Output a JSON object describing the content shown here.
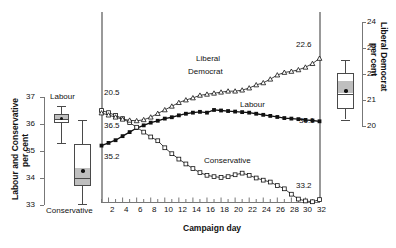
{
  "chart_data": {
    "type": "line",
    "title": "",
    "xlabel": "Campaign day",
    "ylabel_left": "Labour and Conservative per cent",
    "ylabel_right": "Liberal Democrat per cent",
    "x": [
      1,
      2,
      3,
      4,
      5,
      6,
      7,
      8,
      9,
      10,
      11,
      12,
      13,
      14,
      15,
      16,
      17,
      18,
      19,
      20,
      21,
      22,
      23,
      24,
      25,
      26,
      27,
      28,
      29,
      30,
      31,
      32
    ],
    "xlim": [
      1,
      32
    ],
    "xticks": [
      2,
      4,
      6,
      8,
      10,
      12,
      14,
      16,
      18,
      20,
      22,
      24,
      26,
      28,
      30,
      32
    ],
    "ylim_left": [
      33,
      37
    ],
    "yticks_left": [
      33,
      34,
      35,
      36,
      37
    ],
    "ylim_right": [
      20,
      24
    ],
    "yticks_right": [
      20,
      21,
      22,
      23,
      24
    ],
    "grid": false,
    "legend": "inline-annotations",
    "series": [
      {
        "name": "Labour",
        "axis": "left",
        "marker": "filled-square",
        "start_label": "35.2",
        "end_label": "36.1",
        "values": [
          35.2,
          35.3,
          35.4,
          35.55,
          35.7,
          35.85,
          35.95,
          36.05,
          36.12,
          36.2,
          36.25,
          36.32,
          36.38,
          36.42,
          36.45,
          36.42,
          36.52,
          36.5,
          36.48,
          36.46,
          36.44,
          36.42,
          36.38,
          36.34,
          36.3,
          36.26,
          36.22,
          36.2,
          36.18,
          36.15,
          36.13,
          36.1
        ]
      },
      {
        "name": "Conservative",
        "axis": "left",
        "marker": "open-square",
        "start_label": "36.5",
        "end_label": "33.2",
        "values": [
          36.5,
          36.42,
          36.32,
          36.2,
          36.05,
          35.88,
          35.7,
          35.52,
          35.38,
          35.12,
          34.9,
          34.7,
          34.52,
          34.35,
          34.2,
          34.1,
          34.05,
          34.02,
          34.05,
          34.12,
          34.18,
          34.1,
          34.0,
          33.92,
          33.85,
          33.72,
          33.6,
          33.4,
          33.22,
          33.15,
          33.12,
          33.2
        ]
      },
      {
        "name": "Liberal Democrat",
        "axis": "right",
        "marker": "open-triangle",
        "start_label": "20.5",
        "end_label": "22.6",
        "values": [
          20.5,
          20.42,
          20.34,
          20.26,
          20.22,
          20.2,
          20.24,
          20.34,
          20.48,
          20.62,
          20.76,
          20.9,
          21.0,
          21.08,
          21.18,
          21.22,
          21.26,
          21.3,
          21.34,
          21.34,
          21.38,
          21.46,
          21.58,
          21.66,
          21.8,
          21.96,
          22.06,
          22.1,
          22.16,
          22.26,
          22.4,
          22.6
        ]
      }
    ],
    "annotations": [
      {
        "text": "Liberal",
        "series": "Liberal Democrat"
      },
      {
        "text": "Democrat",
        "series": "Liberal Democrat"
      },
      {
        "text": "Labour",
        "series": "Labour"
      },
      {
        "text": "Conservative",
        "series": "Conservative"
      }
    ],
    "boxplots": [
      {
        "name": "Labour",
        "axis": "left",
        "label": "Labour",
        "min": 35.42,
        "q1": 36.05,
        "median": 36.22,
        "q3": 36.38,
        "max": 36.68,
        "mean": 36.18
      },
      {
        "name": "Conservative",
        "axis": "left",
        "label": "Conservative",
        "min": 33.1,
        "q1": 33.7,
        "median": 34.0,
        "q3": 35.25,
        "max": 36.15,
        "mean": 34.32
      },
      {
        "name": "Liberal Democrat",
        "axis": "right",
        "label": "",
        "min": 20.25,
        "q1": 20.62,
        "median": 21.22,
        "q3": 22.05,
        "max": 22.55,
        "mean": 21.25
      }
    ]
  },
  "labels": {
    "y_left_line1": "Labour and Conservative",
    "y_left_line2": "per cent",
    "y_right_line1": "Liberal Democrat",
    "y_right_line2": "per cent",
    "x_axis": "Campaign day",
    "box_labour": "Labour",
    "box_conservative": "Conservative",
    "ann_liberal": "Liberal",
    "ann_democrat": "Democrat",
    "ann_labour": "Labour",
    "ann_conservative": "Conservative",
    "start_libdem": "20.5",
    "start_con": "36.5",
    "start_lab": "35.2",
    "end_libdem": "22.6",
    "end_lab": "36.1",
    "end_con": "33.2",
    "yl_33": "33",
    "yl_34": "34",
    "yl_35": "35",
    "yl_36": "36",
    "yl_37": "37",
    "yr_20": "20",
    "yr_21": "21",
    "yr_22": "22",
    "yr_23": "23",
    "yr_24": "24",
    "xt_2": "2",
    "xt_4": "4",
    "xt_6": "6",
    "xt_8": "8",
    "xt_10": "10",
    "xt_12": "12",
    "xt_14": "14",
    "xt_16": "16",
    "xt_18": "18",
    "xt_20": "20",
    "xt_22": "22",
    "xt_24": "24",
    "xt_26": "26",
    "xt_28": "28",
    "xt_30": "30",
    "xt_32": "32"
  },
  "colors": {
    "ink": "#111111",
    "axis": "#777777",
    "box_fill": "#ffffff",
    "box_shade": "#bfbfbf",
    "background": "#ffffff"
  }
}
